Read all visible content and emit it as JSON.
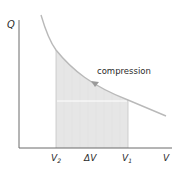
{
  "diagram": {
    "type": "pV-style work diagram",
    "y_axis_label": "Q",
    "x_axis_label": "V",
    "curve_label": "compression",
    "x_ticks": {
      "v2": {
        "main": "V",
        "sub": "2"
      },
      "delta": "ΔV",
      "v1": {
        "main": "V",
        "sub": "1"
      }
    },
    "colors": {
      "axis": "#6b6b6b",
      "curve": "#b9b9b9",
      "shaded_area": "#e6e6e6",
      "arrow": "#9a9a9a",
      "text": "#2b2b2b"
    }
  }
}
